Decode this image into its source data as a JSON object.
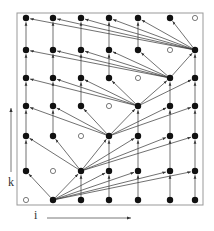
{
  "diagram": {
    "title": "",
    "axes": {
      "horizontal_label": "i",
      "vertical_label": "k"
    },
    "grid": {
      "columns": 7,
      "rows": 7,
      "col_x": [
        26,
        53,
        81,
        109,
        138,
        170,
        195
      ],
      "row_y": [
        200,
        171,
        136,
        106,
        78,
        50,
        18
      ]
    },
    "open_nodes": [
      [
        0,
        0
      ],
      [
        1,
        1
      ],
      [
        2,
        2
      ],
      [
        3,
        3
      ],
      [
        4,
        4
      ],
      [
        5,
        5
      ],
      [
        6,
        6
      ]
    ],
    "hub_nodes": [
      [
        1,
        0
      ],
      [
        2,
        1
      ],
      [
        3,
        2
      ],
      [
        4,
        3
      ],
      [
        5,
        4
      ],
      [
        6,
        5
      ]
    ],
    "colors": {
      "node": "#111111",
      "edge": "#333333",
      "frame": "#999999",
      "background": "#ffffff"
    }
  }
}
